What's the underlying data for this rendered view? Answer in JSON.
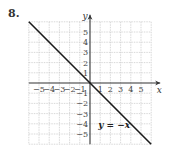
{
  "problem_number": "8.",
  "chart_data": {
    "type": "line",
    "title": "",
    "xlabel": "x",
    "ylabel": "y",
    "xlim": [
      -6,
      6
    ],
    "ylim": [
      -6,
      6
    ],
    "grid": true,
    "x_ticks": [
      -5,
      -4,
      -3,
      -2,
      -1,
      1,
      2,
      3,
      4,
      5
    ],
    "y_ticks": [
      5,
      4,
      3,
      2,
      1,
      -1,
      -2,
      -3,
      -4,
      -5
    ],
    "x_tick_labels": [
      "−5",
      "−4",
      "−3",
      "−2",
      "−1",
      "1",
      "2",
      "3",
      "4",
      "5"
    ],
    "y_tick_labels": [
      "5",
      "4",
      "3",
      "2",
      "1",
      "−1",
      "−2",
      "−3",
      "−4",
      "−5"
    ],
    "series": [
      {
        "name": "y = −x",
        "equation": "y = -x",
        "x": [
          -6,
          6
        ],
        "y": [
          6,
          -6
        ]
      }
    ],
    "annotations": [
      {
        "text": "y = −x",
        "x": 0.8,
        "y": -4.4
      }
    ],
    "colors": {
      "line": "#1a1a1a",
      "axis": "#333333",
      "grid": "#c8c8c8"
    }
  }
}
